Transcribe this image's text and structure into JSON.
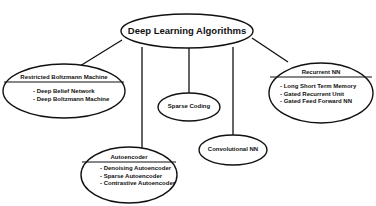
{
  "diagram": {
    "root": {
      "label": "Deep Learning Algorithms"
    },
    "nodes": [
      {
        "id": "rbm",
        "title": "Restricted Boltzmann Machine",
        "items": [
          "- Deep Belief Network",
          "- Deep Boltzmann Machine"
        ]
      },
      {
        "id": "autoencoder",
        "title": "Autoencoder",
        "items": [
          "- Denoising Autoencoder",
          "- Sparse Autoencoder",
          "- Contrastive Autoencoder"
        ]
      },
      {
        "id": "sparse-coding",
        "title": "Sparse Coding",
        "items": []
      },
      {
        "id": "convolutional",
        "title": "Convolutional NN",
        "items": []
      },
      {
        "id": "recurrent",
        "title": "Recurrent NN",
        "items": [
          "- Long Short Term Memory",
          "- Gated Recurrent Unit",
          "- Gated Feed Forward NN"
        ]
      }
    ],
    "colors": {
      "stroke": "#111111",
      "background": "#ffffff",
      "text": "#111111"
    }
  }
}
